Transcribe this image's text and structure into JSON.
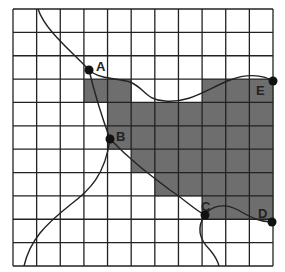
{
  "diagram": {
    "grid": {
      "columns": 11,
      "rows": 11,
      "left": 13,
      "top": 9,
      "right": 273,
      "bottom": 266,
      "line_color": "#222222",
      "shade_color": "#6e6e6e"
    },
    "shaded_cells": [
      {
        "row": 3,
        "cols": [
          3,
          4,
          8,
          9,
          10
        ]
      },
      {
        "row": 4,
        "cols": [
          4,
          5,
          6,
          7,
          8,
          9,
          10
        ]
      },
      {
        "row": 5,
        "cols": [
          4,
          5,
          6,
          7,
          8,
          9,
          10
        ]
      },
      {
        "row": 6,
        "cols": [
          5,
          6,
          7,
          8,
          9,
          10
        ]
      },
      {
        "row": 7,
        "cols": [
          6,
          7,
          8,
          9,
          10
        ]
      },
      {
        "row": 8,
        "cols": [
          8,
          9,
          10
        ]
      }
    ],
    "points": [
      {
        "label": "A",
        "x": 89,
        "y": 70,
        "lx": 96,
        "ly": 71
      },
      {
        "label": "B",
        "x": 110,
        "y": 139,
        "lx": 116,
        "ly": 141
      },
      {
        "label": "C",
        "x": 205,
        "y": 215,
        "lx": 201,
        "ly": 211
      },
      {
        "label": "D",
        "x": 272,
        "y": 222,
        "lx": 258,
        "ly": 218
      },
      {
        "label": "E",
        "x": 273,
        "y": 81,
        "lx": 256,
        "ly": 95
      }
    ],
    "curves": [
      {
        "name": "top-to-A",
        "d": "M38,9 C45,30 70,50 89,70"
      },
      {
        "name": "A-to-B",
        "d": "M89,70 C95,95 103,120 110,139"
      },
      {
        "name": "B-to-bottom",
        "d": "M110,139 C105,175 90,190 70,205 C45,225 30,240 24,266"
      },
      {
        "name": "A-to-E",
        "d": "M89,70 C100,80 120,78 130,82 C145,88 145,100 165,101 C190,103 205,90 230,80 C245,74 262,74 273,81"
      },
      {
        "name": "B-to-C",
        "d": "M110,139 C130,160 150,175 170,190 C185,200 195,210 205,215"
      },
      {
        "name": "C-to-D",
        "d": "M205,215 C212,205 225,203 238,210 C252,218 260,222 272,222"
      },
      {
        "name": "C-to-bottom",
        "d": "M205,215 C196,228 200,240 210,250 C215,256 218,262 219,266"
      }
    ]
  }
}
